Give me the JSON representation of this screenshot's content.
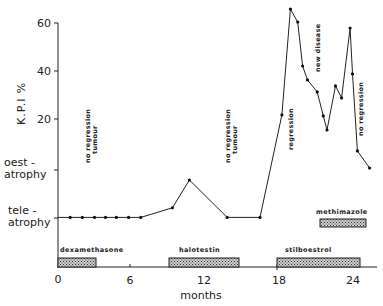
{
  "chart_data": {
    "type": "line",
    "title": "",
    "xlabel": "months",
    "ylabel": "K.P.I %",
    "xlim": [
      0,
      26.5
    ],
    "ylim": [
      -28,
      62
    ],
    "x_ticks": [
      0,
      6,
      12,
      18,
      24
    ],
    "y_ticks": [
      20,
      40,
      60
    ],
    "y_categorical_ticks": [
      {
        "label_line1": "oest -",
        "label_line2": "atrophy",
        "value": -1
      },
      {
        "label_line1": "tele -",
        "label_line2": "atrophy",
        "value": -21
      }
    ],
    "grid": false,
    "series": [
      {
        "name": "K.P.I",
        "points": [
          [
            0.0,
            -21
          ],
          [
            1.0,
            -21
          ],
          [
            2.0,
            -21
          ],
          [
            3.0,
            -21
          ],
          [
            3.9,
            -21
          ],
          [
            4.8,
            -21
          ],
          [
            5.8,
            -21
          ],
          [
            6.8,
            -21
          ],
          [
            9.4,
            -17
          ],
          [
            10.8,
            -5.4
          ],
          [
            13.9,
            -21
          ],
          [
            16.6,
            -21
          ],
          [
            18.4,
            21.7
          ],
          [
            19.1,
            65.8
          ],
          [
            19.7,
            60.4
          ],
          [
            20.1,
            42.1
          ],
          [
            20.5,
            36.3
          ],
          [
            21.3,
            31.3
          ],
          [
            21.8,
            21.3
          ],
          [
            22.1,
            15.4
          ],
          [
            22.8,
            33.8
          ],
          [
            23.3,
            28.8
          ],
          [
            24.0,
            57.9
          ],
          [
            24.2,
            38.8
          ],
          [
            24.6,
            6.7
          ],
          [
            25.6,
            -0.4
          ]
        ]
      }
    ],
    "annotations": [
      {
        "lines": [
          "no regression",
          "tumour"
        ],
        "x": 2.6,
        "y_top": 22,
        "rotated": true
      },
      {
        "lines": [
          "no regression",
          "tumour"
        ],
        "x": 14.2,
        "y_top": 22,
        "rotated": true
      },
      {
        "lines": [
          "regression"
        ],
        "x": 19.1,
        "y_top": 23,
        "rotated": true
      },
      {
        "lines": [
          "new disease"
        ],
        "x": 21.4,
        "y_top": 58,
        "rotated": true
      },
      {
        "lines": [
          "no regression"
        ],
        "x": 24.8,
        "y_top": 36,
        "rotated": true
      }
    ],
    "treatments": [
      {
        "name": "dexamethasone",
        "start": 0.0,
        "end": 3.1,
        "row": "bottom"
      },
      {
        "name": "halotestin",
        "start": 9.1,
        "end": 14.9,
        "row": "bottom"
      },
      {
        "name": "stilboestrol",
        "start": 18.0,
        "end": 24.8,
        "row": "bottom"
      },
      {
        "name": "methimazole",
        "start": 21.5,
        "end": 25.3,
        "row": "upper"
      }
    ]
  },
  "labels": {
    "y60": "60",
    "y40": "40",
    "y20": "20",
    "oest1": "oest -",
    "oest2": "atrophy",
    "tele1": "tele -",
    "tele2": "atrophy",
    "x0": "0",
    "x6": "6",
    "x12": "12",
    "x18": "18",
    "x24": "24",
    "xlabel": "months",
    "ylabel": "K.P.I %",
    "annot_noreg": "no regression",
    "annot_tumour": "tumour",
    "annot_regression": "regression",
    "annot_newdisease": "new disease",
    "drug_dex": "dexamethasone",
    "drug_halo": "halotestin",
    "drug_stil": "stilboestrol",
    "drug_meth": "methimazole"
  }
}
